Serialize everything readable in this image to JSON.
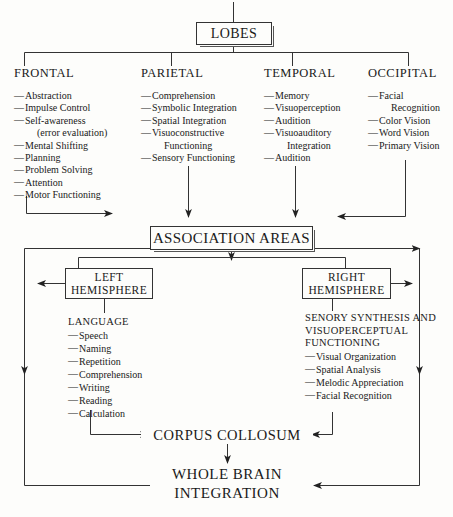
{
  "diagram": {
    "root": {
      "label": "LOBES"
    },
    "association": {
      "label": "ASSOCIATION AREAS"
    },
    "corpus": {
      "label": "CORPUS COLLOSUM"
    },
    "whole_brain": {
      "line1": "WHOLE BRAIN",
      "line2": "INTEGRATION"
    },
    "lobes": [
      {
        "name": "frontal",
        "title": "FRONTAL",
        "items": [
          {
            "text": "Abstraction"
          },
          {
            "text": "Impulse Control"
          },
          {
            "text": "Self-awareness",
            "cont": "(error evaluation)"
          },
          {
            "text": "Mental Shifting"
          },
          {
            "text": "Planning"
          },
          {
            "text": "Problem Solving"
          },
          {
            "text": "Attention"
          },
          {
            "text": "Motor Functioning"
          }
        ]
      },
      {
        "name": "parietal",
        "title": "PARIETAL",
        "items": [
          {
            "text": "Comprehension"
          },
          {
            "text": "Symbolic Integration"
          },
          {
            "text": "Spatial Integration"
          },
          {
            "text": "Visuoconstructive",
            "cont": "Functioning"
          },
          {
            "text": "Sensory Functioning"
          }
        ]
      },
      {
        "name": "temporal",
        "title": "TEMPORAL",
        "items": [
          {
            "text": "Memory"
          },
          {
            "text": "Visuoperception"
          },
          {
            "text": "Audition"
          },
          {
            "text": "Visuoauditory",
            "cont": "Integration"
          },
          {
            "text": "Audition"
          }
        ]
      },
      {
        "name": "occipital",
        "title": "OCCIPITAL",
        "items": [
          {
            "text": "Facial",
            "cont": "Recognition"
          },
          {
            "text": "Color Vision"
          },
          {
            "text": "Word Vision"
          },
          {
            "text": "Primary Vision"
          }
        ]
      }
    ],
    "hemispheres": [
      {
        "name": "left",
        "line1": "LEFT",
        "line2": "HEMISPHERE",
        "heading": "LANGUAGE",
        "items": [
          {
            "text": "Speech"
          },
          {
            "text": "Naming"
          },
          {
            "text": "Repetition"
          },
          {
            "text": "Comprehension"
          },
          {
            "text": "Writing"
          },
          {
            "text": "Reading"
          },
          {
            "text": "Calculation"
          }
        ]
      },
      {
        "name": "right",
        "line1": "RIGHT",
        "line2": "HEMISPHERE",
        "heading_line1": "SENORY SYNTHESIS AND",
        "heading_line2": "VISUOPERCEPTUAL",
        "heading_line3": "FUNCTIONING",
        "items": [
          {
            "text": "Visual Organization"
          },
          {
            "text": "Spatial Analysis"
          },
          {
            "text": "Melodic Appreciation"
          },
          {
            "text": "Facial Recognition"
          }
        ]
      }
    ],
    "glyphs": {
      "dash": "—"
    },
    "colors": {
      "line": "#333333",
      "text": "#1a1a1a",
      "background": "#fdfdfb"
    }
  }
}
